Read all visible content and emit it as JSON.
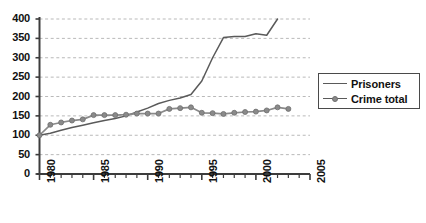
{
  "chart_data": {
    "type": "line",
    "title": "",
    "xlabel": "",
    "ylabel": "",
    "xlim": [
      1980,
      2005
    ],
    "ylim": [
      0,
      400
    ],
    "grid": true,
    "grid_axis": "y",
    "legend_position": "right-middle",
    "y_ticks": [
      0,
      50,
      100,
      150,
      200,
      250,
      300,
      350,
      400
    ],
    "y_tick_labels": [
      "0",
      "50",
      "100",
      "150",
      "200",
      "250",
      "300",
      "350",
      "400"
    ],
    "x_ticks": [
      1980,
      1985,
      1990,
      1995,
      2000,
      2005
    ],
    "x_tick_labels": [
      "1980",
      "1985",
      "1990",
      "1995",
      "2000",
      "2005"
    ],
    "x_minor_tick_interval": 1,
    "series": [
      {
        "name": "Prisoners",
        "color": "#5a5a5a",
        "marker": "none",
        "x": [
          1980,
          1981,
          1982,
          1983,
          1984,
          1985,
          1986,
          1987,
          1988,
          1989,
          1990,
          1991,
          1992,
          1993,
          1994,
          1995,
          1996,
          1997,
          1998,
          1999,
          2000,
          2001,
          2002
        ],
        "values": [
          100,
          105,
          113,
          120,
          126,
          132,
          138,
          143,
          150,
          160,
          170,
          182,
          190,
          196,
          205,
          240,
          300,
          352,
          355,
          355,
          362,
          358,
          400
        ]
      },
      {
        "name": "Crime total",
        "color": "#8a8a8a",
        "marker": "circle",
        "x": [
          1980,
          1981,
          1982,
          1983,
          1984,
          1985,
          1986,
          1987,
          1988,
          1989,
          1990,
          1991,
          1992,
          1993,
          1994,
          1995,
          1996,
          1997,
          1998,
          1999,
          2000,
          2001,
          2002,
          2003
        ],
        "values": [
          100,
          127,
          133,
          138,
          141,
          152,
          152,
          152,
          153,
          156,
          156,
          156,
          168,
          170,
          172,
          158,
          157,
          155,
          158,
          160,
          161,
          164,
          172,
          168
        ]
      }
    ]
  },
  "legend": {
    "items": [
      {
        "label": "Prisoners"
      },
      {
        "label": "Crime total"
      }
    ]
  }
}
